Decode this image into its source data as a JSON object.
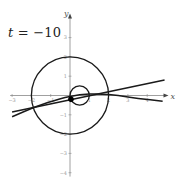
{
  "figure": {
    "parameter_label": {
      "variable": "t",
      "equals": " = ",
      "value": "−10"
    },
    "axes": {
      "x_label": "x",
      "y_label": "y",
      "origin_px": [
        70,
        95.5
      ],
      "unit_px": 19.3,
      "x_range": [
        -3.1,
        5
      ],
      "y_range": [
        -4.2,
        4.2
      ],
      "x_ticks": [
        {
          "value": -3,
          "label": "−3"
        },
        {
          "value": -2,
          "label": "−2"
        },
        {
          "value": -1,
          "label": "−1"
        },
        {
          "value": 1,
          "label": "1"
        },
        {
          "value": 2,
          "label": "2"
        },
        {
          "value": 3,
          "label": "3"
        },
        {
          "value": 4,
          "label": "4"
        }
      ],
      "y_ticks": [
        {
          "value": 3,
          "label": "3"
        },
        {
          "value": 2,
          "label": "2"
        },
        {
          "value": 1,
          "label": "1"
        },
        {
          "value": -1,
          "label": "−1"
        },
        {
          "value": -2,
          "label": "−2"
        },
        {
          "value": -3,
          "label": "−3"
        },
        {
          "value": -4,
          "label": "−4"
        }
      ],
      "axis_color": "#888888"
    },
    "shapes": {
      "large_circle": {
        "center": [
          0,
          0
        ],
        "radius": 2
      },
      "small_circle": {
        "center": [
          0.5,
          0
        ],
        "radius": 0.5
      },
      "point": {
        "x": 0.05,
        "y": -0.2
      },
      "upper_line": {
        "from": [
          -3.0,
          -0.85
        ],
        "to": [
          4.9,
          0.8
        ]
      },
      "lower_curve": {
        "points": [
          [
            -3.0,
            -1.1
          ],
          [
            -1.8,
            -0.58
          ],
          [
            -0.5,
            -0.15
          ],
          [
            0.5,
            0.05
          ],
          [
            1.5,
            0.1
          ],
          [
            2.5,
            0.0
          ],
          [
            3.5,
            -0.15
          ],
          [
            4.8,
            -0.3
          ]
        ]
      },
      "curve_color": "#1a1a1a"
    }
  }
}
